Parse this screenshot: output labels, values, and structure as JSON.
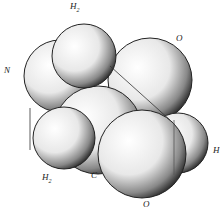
{
  "diagram": {
    "type": "space-filling molecular model",
    "atoms": [
      {
        "id": "N",
        "label": "N",
        "x": 62,
        "y": 75,
        "r": 36
      },
      {
        "id": "H2_top",
        "label": "H",
        "sub": "2",
        "x": 84,
        "y": 56,
        "r": 32
      },
      {
        "id": "O_top",
        "label": "O",
        "x": 148,
        "y": 78,
        "r": 42
      },
      {
        "id": "H2_bottom",
        "label": "H",
        "sub": "2",
        "x": 62,
        "y": 138,
        "r": 32
      },
      {
        "id": "C",
        "label": "C",
        "x": 100,
        "y": 128,
        "r": 44
      },
      {
        "id": "O_bottom",
        "label": "O",
        "x": 140,
        "y": 155,
        "r": 44
      },
      {
        "id": "H",
        "label": "H",
        "x": 180,
        "y": 143,
        "r": 30
      }
    ],
    "labels": [
      {
        "text": "H",
        "sub": "2",
        "x": 70,
        "y": 7
      },
      {
        "text": "O",
        "x": 177,
        "y": 38
      },
      {
        "text": "N",
        "x": 4,
        "y": 70
      },
      {
        "text": "H",
        "sub": "2",
        "x": 43,
        "y": 177
      },
      {
        "text": "C",
        "x": 91,
        "y": 175
      },
      {
        "text": "H",
        "x": 214,
        "y": 150
      },
      {
        "text": "O",
        "x": 143,
        "y": 199
      }
    ]
  }
}
